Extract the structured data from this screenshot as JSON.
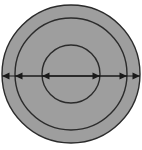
{
  "figure": {
    "name": "concentric-circles-diameter-diagram",
    "canvas": {
      "width": 142,
      "height": 150,
      "background": "#ffffff"
    },
    "center": {
      "x": 71,
      "y": 74
    },
    "fill_color": "#9e9e9e",
    "stroke_color": "#2b2b2b",
    "arrow_color": "#1a1a1a",
    "stroke_width": 1.4,
    "circles": [
      {
        "id": "outer-circle",
        "label": "",
        "radius": 69,
        "fill": "#9e9e9e",
        "stroke": "#2b2b2b",
        "top_y": 5,
        "bottom_y": 143,
        "left_x": 2,
        "right_x": 140
      },
      {
        "id": "middle-circle",
        "label": "",
        "radius": 56,
        "fill": "#9e9e9e",
        "stroke": "#2b2b2b",
        "top_y": 18,
        "bottom_y": 130,
        "left_x": 15,
        "right_x": 127
      },
      {
        "id": "inner-circle",
        "label": "",
        "radius": 29,
        "fill": "#9e9e9e",
        "stroke": "#2b2b2b",
        "top_y": 45,
        "bottom_y": 103,
        "left_x": 42,
        "right_x": 100
      }
    ],
    "diameter_arrows": [
      {
        "id": "outer-diameter-arrow",
        "label": "",
        "y": 76,
        "x1": 2,
        "x2": 140,
        "double_headed": true,
        "color": "#1a1a1a"
      },
      {
        "id": "middle-diameter-arrow",
        "label": "",
        "y": 76,
        "x1": 15,
        "x2": 127,
        "double_headed": true,
        "color": "#1a1a1a"
      },
      {
        "id": "inner-diameter-arrow",
        "label": "",
        "y": 76,
        "x1": 42,
        "x2": 100,
        "double_headed": true,
        "color": "#1a1a1a"
      }
    ],
    "annotations": []
  },
  "chart_data": {
    "type": "diagram",
    "title": "",
    "subtitle": "",
    "xlabel": "",
    "ylabel": "",
    "shape": "concentric-circles",
    "series": [
      {
        "name": "outer-circle",
        "radius": 69,
        "diameter": 138,
        "diameter_arrow_span": [
          2,
          140
        ]
      },
      {
        "name": "middle-circle",
        "radius": 56,
        "diameter": 112,
        "diameter_arrow_span": [
          15,
          127
        ]
      },
      {
        "name": "inner-circle",
        "radius": 29,
        "diameter": 58,
        "diameter_arrow_span": [
          42,
          100
        ]
      }
    ],
    "legend": [],
    "grid": false
  }
}
